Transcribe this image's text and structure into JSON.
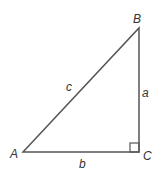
{
  "diagram": {
    "type": "right-triangle",
    "stroke_color": "#555555",
    "vertices": [
      {
        "label": "A",
        "x": 23,
        "y": 152
      },
      {
        "label": "B",
        "x": 139,
        "y": 28
      },
      {
        "label": "C",
        "x": 139,
        "y": 152
      }
    ],
    "sides": [
      {
        "label": "c",
        "from": "A",
        "to": "B"
      },
      {
        "label": "a",
        "from": "B",
        "to": "C"
      },
      {
        "label": "b",
        "from": "A",
        "to": "C"
      }
    ],
    "right_angle_at": "C"
  }
}
